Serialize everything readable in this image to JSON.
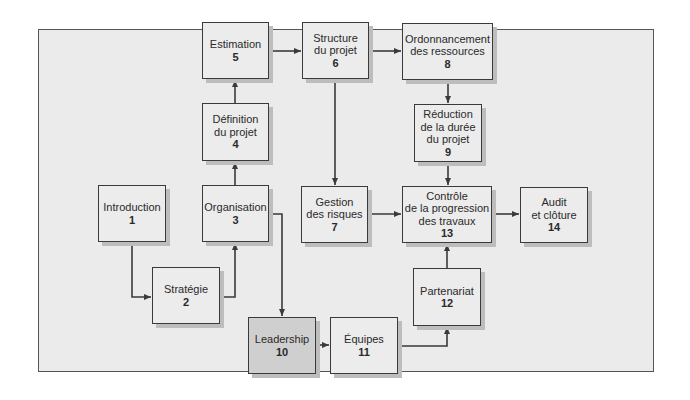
{
  "diagram": {
    "type": "flowchart",
    "nodes": [
      {
        "id": 1,
        "lines": [
          "Introduction"
        ],
        "num": "1"
      },
      {
        "id": 2,
        "lines": [
          "Stratégie"
        ],
        "num": "2"
      },
      {
        "id": 3,
        "lines": [
          "Organisation"
        ],
        "num": "3"
      },
      {
        "id": 4,
        "lines": [
          "Définition",
          "du projet"
        ],
        "num": "4"
      },
      {
        "id": 5,
        "lines": [
          "Estimation"
        ],
        "num": "5"
      },
      {
        "id": 6,
        "lines": [
          "Structure",
          "du projet"
        ],
        "num": "6"
      },
      {
        "id": 7,
        "lines": [
          "Gestion",
          "des risques"
        ],
        "num": "7"
      },
      {
        "id": 8,
        "lines": [
          "Ordonnancement",
          "des ressources"
        ],
        "num": "8"
      },
      {
        "id": 9,
        "lines": [
          "Réduction",
          "de la durée",
          "du projet"
        ],
        "num": "9"
      },
      {
        "id": 10,
        "lines": [
          "Leadership"
        ],
        "num": "10",
        "highlight": true
      },
      {
        "id": 11,
        "lines": [
          "Équipes"
        ],
        "num": "11"
      },
      {
        "id": 12,
        "lines": [
          "Partenariat"
        ],
        "num": "12"
      },
      {
        "id": 13,
        "lines": [
          "Contrôle",
          "de la progression",
          "des travaux"
        ],
        "num": "13"
      },
      {
        "id": 14,
        "lines": [
          "Audit",
          "et clôture"
        ],
        "num": "14"
      }
    ],
    "edges": [
      [
        1,
        2
      ],
      [
        2,
        3
      ],
      [
        3,
        4
      ],
      [
        4,
        5
      ],
      [
        5,
        6
      ],
      [
        6,
        8
      ],
      [
        6,
        7
      ],
      [
        8,
        9
      ],
      [
        9,
        13
      ],
      [
        7,
        13
      ],
      [
        13,
        14
      ],
      [
        3,
        10
      ],
      [
        10,
        11
      ],
      [
        11,
        12
      ],
      [
        12,
        13
      ]
    ],
    "colors": {
      "panel": "#ebebeb",
      "box": "#ececec",
      "highlight_box": "#cfcfcf",
      "line": "#3a3a3a",
      "shadow": "#bdbdbd"
    }
  }
}
